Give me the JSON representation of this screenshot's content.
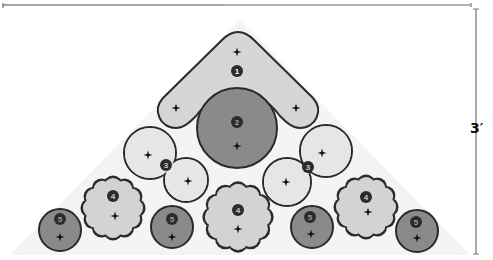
{
  "diagram": {
    "type": "planting-plan",
    "bed_shape": "triangle",
    "dimension": {
      "label": "3′",
      "axis": "vertical"
    },
    "colors": {
      "light_fill": "#d8d8d8",
      "pale_fill": "#e6e6e6",
      "dark_fill": "#8a8a8a",
      "stroke": "#2a2a2a",
      "badge": "#2b2b2b",
      "bed_shading": "#f3f3f3",
      "dimension_line": "#8c8c8c"
    },
    "plants": [
      {
        "id": "1",
        "shape": "chevron",
        "label": "1"
      },
      {
        "id": "2",
        "shape": "circle",
        "label": "2"
      },
      {
        "id": "3a",
        "shape": "double-circle",
        "label": "3"
      },
      {
        "id": "3b",
        "shape": "double-circle",
        "label": "3"
      },
      {
        "id": "4a",
        "shape": "scalloped",
        "label": "4"
      },
      {
        "id": "4b",
        "shape": "scalloped",
        "label": "4"
      },
      {
        "id": "4c",
        "shape": "scalloped",
        "label": "4"
      },
      {
        "id": "5a",
        "shape": "circle",
        "label": "5"
      },
      {
        "id": "5b",
        "shape": "circle",
        "label": "5"
      },
      {
        "id": "5c",
        "shape": "circle",
        "label": "5"
      },
      {
        "id": "5d",
        "shape": "circle",
        "label": "5"
      }
    ]
  }
}
